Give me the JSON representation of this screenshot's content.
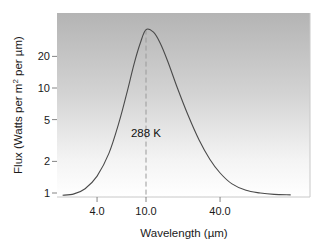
{
  "chart_data": {
    "type": "line",
    "title": "",
    "xlabel": "Wavelength (µm)",
    "ylabel": "Flux (Watts per m² per µm)",
    "ylabel_parts": {
      "prefix": "Flux (Watts per m",
      "sup": "2",
      "suffix": " per µm)"
    },
    "xscale": "log",
    "yscale": "log",
    "xlim": [
      2.0,
      160.0
    ],
    "ylim": [
      0.95,
      60.0
    ],
    "x_ticks": [
      4.0,
      10.0,
      40.0
    ],
    "x_tick_labels": [
      "4.0",
      "10.0",
      "40.0"
    ],
    "y_ticks": [
      1,
      2,
      5,
      10,
      20
    ],
    "y_tick_labels": [
      "1",
      "2",
      "5",
      "10",
      "20"
    ],
    "grid": false,
    "legend": null,
    "background": "vertical gradient, gray at top to white at bottom",
    "series": [
      {
        "name": "288 K blackbody",
        "color": "#4a4a4a",
        "x": [
          2.1,
          2.6,
          3.2,
          4.0,
          5.0,
          6.0,
          7.0,
          8.0,
          9.0,
          10.0,
          11.5,
          13.0,
          15.0,
          18.0,
          22.0,
          27.0,
          33.0,
          40.0,
          50.0,
          65.0,
          85.0,
          110.0,
          150.0
        ],
        "y": [
          0.95,
          0.98,
          1.1,
          1.45,
          2.4,
          4.6,
          9.0,
          17.0,
          27.0,
          36.0,
          34.0,
          27.0,
          18.0,
          10.0,
          5.5,
          3.2,
          2.1,
          1.55,
          1.22,
          1.06,
          1.0,
          0.97,
          0.96
        ]
      }
    ],
    "annotations": [
      {
        "text": "288 K",
        "x": 10.0,
        "y": 3.7
      },
      {
        "type": "vline-dashed",
        "x": 10.0,
        "from_y": 0.95,
        "to_y": 36.0
      }
    ]
  }
}
